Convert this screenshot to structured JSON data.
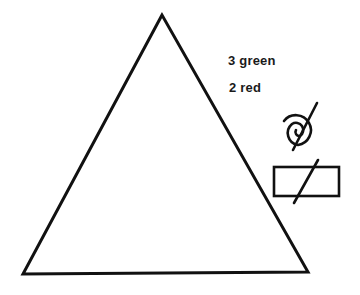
{
  "diagram": {
    "shapes": {
      "triangle": {
        "stroke": "#111111"
      },
      "spiral_symbol": "spiral-slash-icon",
      "rectangle_symbol": "rectangle-slash-icon"
    },
    "labels": {
      "green": "3 green",
      "red": "2 red"
    }
  }
}
